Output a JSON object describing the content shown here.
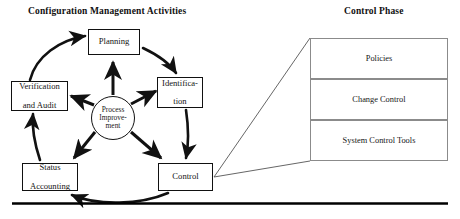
{
  "diagram": {
    "titles": {
      "left": "Configuration Management Activities",
      "right": "Control Phase"
    },
    "cycle": {
      "center": {
        "id": "process-improvement",
        "label": "Process Improve-ment",
        "line1": "Process",
        "line2": "Improve-",
        "line3": "ment"
      },
      "nodes": [
        {
          "id": "planning",
          "label": "Planning",
          "line1": "Planning",
          "line2": ""
        },
        {
          "id": "identification",
          "label": "Identification",
          "line1": "Identifica-",
          "line2": "tion"
        },
        {
          "id": "control",
          "label": "Control",
          "line1": "Control",
          "line2": ""
        },
        {
          "id": "status-accounting",
          "label": "Status Accounting",
          "line1": "Status",
          "line2": "Accounting"
        },
        {
          "id": "verification-and-audit",
          "label": "Verification and Audit",
          "line1": "Verification",
          "line2": "and Audit"
        }
      ]
    },
    "control_phase_panel": {
      "rows": [
        {
          "id": "policies",
          "label": "Policies"
        },
        {
          "id": "change-control",
          "label": "Change Control"
        },
        {
          "id": "system-control-tools",
          "label": "System Control Tools"
        }
      ]
    },
    "colors": {
      "stroke": "#111111",
      "panel_border": "#8b8b8b",
      "callout_line": "#555555",
      "background": "#ffffff",
      "baseline": "#000000"
    }
  }
}
